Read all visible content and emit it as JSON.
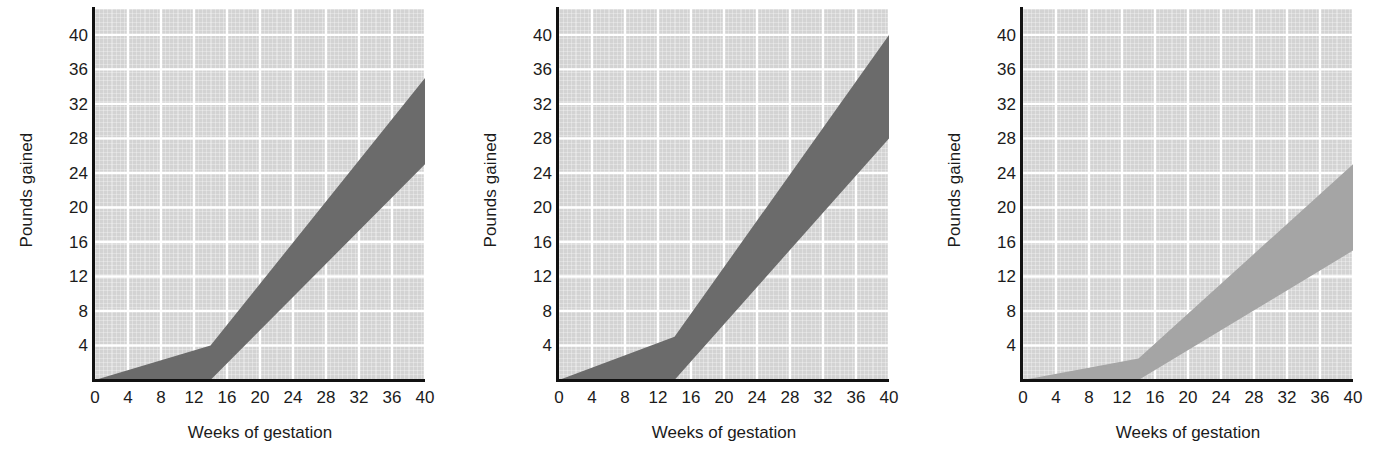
{
  "figure": {
    "panel_count": 3,
    "background_color": "#ffffff",
    "plot_background_color": "#d3d3d3",
    "gridline_color": "#ffffff",
    "axis_color": "#111111"
  },
  "chart_data": [
    {
      "type": "area",
      "title": "",
      "panel_index": 1,
      "panel_name": "underweight-bmi-weight-gain-range",
      "xlabel": "Weeks of gestation",
      "ylabel": "Pounds gained",
      "xlim": [
        0,
        40
      ],
      "ylim": [
        0,
        43
      ],
      "xticks": [
        0,
        4,
        8,
        12,
        16,
        20,
        24,
        28,
        32,
        36,
        40
      ],
      "xtick_labels": [
        "0",
        "4",
        "8",
        "12",
        "16",
        "20",
        "24",
        "28",
        "32",
        "36",
        "40"
      ],
      "yticks": [
        4,
        8,
        12,
        16,
        20,
        24,
        28,
        32,
        36,
        40
      ],
      "ytick_labels": [
        "4",
        "8",
        "12",
        "16",
        "20",
        "24",
        "28",
        "32",
        "36",
        "40"
      ],
      "grid": true,
      "legend": "none",
      "band_color": "#6b6b6b",
      "x": [
        0,
        14,
        40
      ],
      "series": [
        {
          "name": "Upper limit",
          "values": [
            0,
            4,
            35
          ]
        },
        {
          "name": "Lower limit",
          "values": [
            0,
            0,
            25
          ]
        }
      ]
    },
    {
      "type": "area",
      "title": "",
      "panel_index": 2,
      "panel_name": "normal-bmi-weight-gain-range",
      "xlabel": "Weeks of gestation",
      "ylabel": "Pounds gained",
      "xlim": [
        0,
        40
      ],
      "ylim": [
        0,
        43
      ],
      "xticks": [
        0,
        4,
        8,
        12,
        16,
        20,
        24,
        28,
        32,
        36,
        40
      ],
      "xtick_labels": [
        "0",
        "4",
        "8",
        "12",
        "16",
        "20",
        "24",
        "28",
        "32",
        "36",
        "40"
      ],
      "yticks": [
        4,
        8,
        12,
        16,
        20,
        24,
        28,
        32,
        36,
        40
      ],
      "ytick_labels": [
        "4",
        "8",
        "12",
        "16",
        "20",
        "24",
        "28",
        "32",
        "36",
        "40"
      ],
      "grid": true,
      "legend": "none",
      "band_color": "#6b6b6b",
      "x": [
        0,
        14,
        40
      ],
      "series": [
        {
          "name": "Upper limit",
          "values": [
            0,
            5,
            40
          ]
        },
        {
          "name": "Lower limit",
          "values": [
            0,
            0,
            28
          ]
        }
      ]
    },
    {
      "type": "area",
      "title": "",
      "panel_index": 3,
      "panel_name": "overweight-bmi-weight-gain-range",
      "xlabel": "Weeks of gestation",
      "ylabel": "Pounds gained",
      "xlim": [
        0,
        40
      ],
      "ylim": [
        0,
        43
      ],
      "xticks": [
        0,
        4,
        8,
        12,
        16,
        20,
        24,
        28,
        32,
        36,
        40
      ],
      "xtick_labels": [
        "0",
        "4",
        "8",
        "12",
        "16",
        "20",
        "24",
        "28",
        "32",
        "36",
        "40"
      ],
      "yticks": [
        4,
        8,
        12,
        16,
        20,
        24,
        28,
        32,
        36,
        40
      ],
      "ytick_labels": [
        "4",
        "8",
        "12",
        "16",
        "20",
        "24",
        "28",
        "32",
        "36",
        "40"
      ],
      "grid": true,
      "legend": "none",
      "band_color": "#a5a5a5",
      "x": [
        0,
        14,
        40
      ],
      "series": [
        {
          "name": "Upper limit",
          "values": [
            0,
            2.5,
            25
          ]
        },
        {
          "name": "Lower limit",
          "values": [
            0,
            0,
            15
          ]
        }
      ]
    }
  ]
}
